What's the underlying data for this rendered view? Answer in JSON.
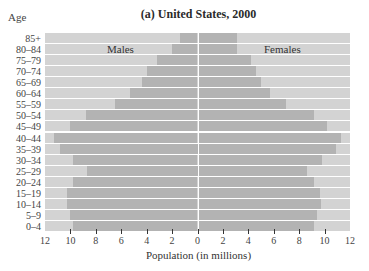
{
  "chart_data": {
    "type": "bar",
    "subtype": "population-pyramid",
    "title": "(a) United States, 2000",
    "xlabel": "Population (in millions)",
    "ylabel": "Age",
    "xlim": [
      -12,
      12
    ],
    "x_ticks": [
      "12",
      "10",
      "8",
      "6",
      "4",
      "2",
      "0",
      "2",
      "4",
      "6",
      "8",
      "10",
      "12"
    ],
    "grid": false,
    "legend": [
      "Males",
      "Females"
    ],
    "categories": [
      "85+",
      "80–84",
      "75–79",
      "70–74",
      "65–69",
      "60–64",
      "55–59",
      "50–54",
      "45–49",
      "40–44",
      "35–39",
      "30–34",
      "25–29",
      "20–24",
      "15–19",
      "10–14",
      "5–9",
      "0–4"
    ],
    "series": [
      {
        "name": "Males",
        "values": [
          1.4,
          2.0,
          3.2,
          4.0,
          4.4,
          5.3,
          6.5,
          8.8,
          10.0,
          11.3,
          10.8,
          9.8,
          8.7,
          9.8,
          10.3,
          10.3,
          10.0,
          9.8
        ]
      },
      {
        "name": "Females",
        "values": [
          3.1,
          3.1,
          4.2,
          4.6,
          5.0,
          5.7,
          7.0,
          9.2,
          10.2,
          11.3,
          10.9,
          9.8,
          8.6,
          9.2,
          9.6,
          9.7,
          9.4,
          9.2
        ]
      }
    ],
    "colors": {
      "bar": "#b3b3b3",
      "background": "#d3d3d3"
    }
  }
}
